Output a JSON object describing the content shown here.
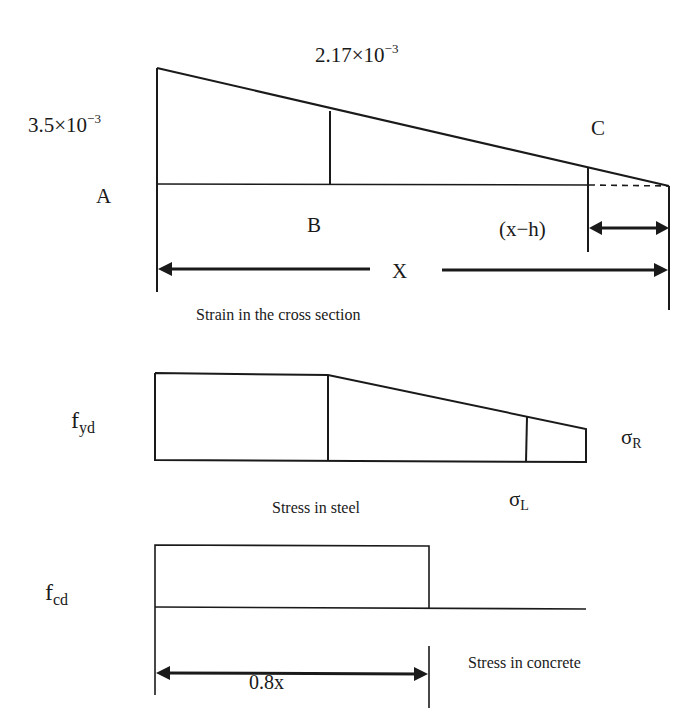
{
  "strain_diagram": {
    "strain_at_top": "3.5×10",
    "strain_at_top_exp": "−3",
    "strain_at_B": "2.17×10",
    "strain_at_B_exp": "−3",
    "point_A": "A",
    "point_B": "B",
    "point_C": "C",
    "neutral_axis_depth": "X",
    "tension_zone": "(x−h)",
    "caption": "Strain in the cross section"
  },
  "steel_stress_diagram": {
    "yield_label": "f",
    "yield_sub": "yd",
    "sigma_left": "σ",
    "sigma_left_sub": "L",
    "sigma_right": "σ",
    "sigma_right_sub": "R",
    "caption": "Stress in steel"
  },
  "concrete_stress_diagram": {
    "design_strength": "f",
    "design_strength_sub": "cd",
    "block_depth": "0.8x",
    "caption": "Stress in concrete"
  }
}
